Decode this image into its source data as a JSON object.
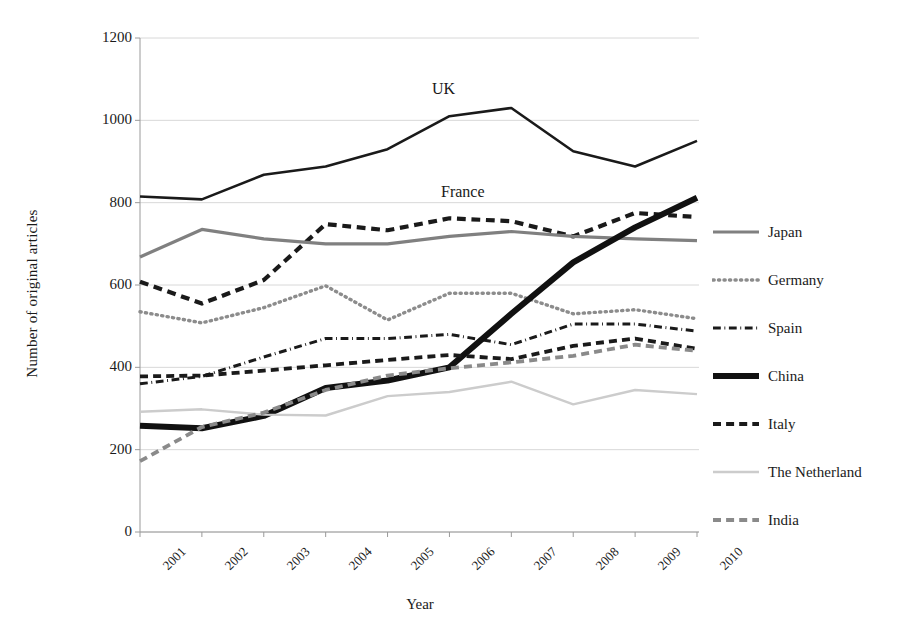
{
  "chart_data": {
    "type": "line",
    "title": "",
    "xlabel": "Year",
    "ylabel": "Number of original articles",
    "x": [
      2001,
      2002,
      2003,
      2004,
      2005,
      2006,
      2007,
      2008,
      2009,
      2010
    ],
    "categories": [
      "2001",
      "2002",
      "2003",
      "2004",
      "2005",
      "2006",
      "2007",
      "2008",
      "2009",
      "2010"
    ],
    "xlim": [
      2001,
      2010
    ],
    "ylim": [
      0,
      1200
    ],
    "yticks": [
      0,
      200,
      400,
      600,
      800,
      1000,
      1200
    ],
    "ytick_labels": [
      "0",
      "200",
      "400",
      "600",
      "800",
      "1000",
      "1200"
    ],
    "grid": "horizontal",
    "legend_position": "right",
    "series": [
      {
        "name": "UK",
        "values": [
          815,
          808,
          868,
          888,
          930,
          1010,
          1030,
          925,
          888,
          950
        ],
        "style": "solid",
        "color": "#1a1a1a",
        "width": 2.6,
        "in_legend": false,
        "annotated": true
      },
      {
        "name": "France",
        "values": [
          608,
          555,
          612,
          748,
          733,
          762,
          755,
          718,
          775,
          765
        ],
        "style": "dashed",
        "color": "#1a1a1a",
        "width": 4.2,
        "in_legend": false,
        "annotated": true
      },
      {
        "name": "Japan",
        "values": [
          668,
          735,
          712,
          700,
          700,
          718,
          730,
          718,
          712,
          708
        ],
        "style": "solid",
        "color": "#808080",
        "width": 3.2,
        "in_legend": true
      },
      {
        "name": "Germany",
        "values": [
          535,
          508,
          545,
          598,
          515,
          580,
          580,
          530,
          540,
          518
        ],
        "style": "dotted",
        "color": "#8c8c8c",
        "width": 3.4,
        "in_legend": true
      },
      {
        "name": "Spain",
        "values": [
          360,
          378,
          425,
          470,
          470,
          480,
          455,
          505,
          505,
          488
        ],
        "style": "dashdot",
        "color": "#1a1a1a",
        "width": 3.0,
        "in_legend": true
      },
      {
        "name": "China",
        "values": [
          258,
          252,
          282,
          350,
          368,
          400,
          530,
          655,
          740,
          812
        ],
        "style": "solid",
        "color": "#111111",
        "width": 6.0,
        "in_legend": true
      },
      {
        "name": "Italy",
        "values": [
          378,
          380,
          392,
          405,
          418,
          430,
          420,
          452,
          470,
          445
        ],
        "style": "dashed",
        "color": "#1a1a1a",
        "width": 3.8,
        "in_legend": true
      },
      {
        "name": "The Netherland",
        "values": [
          292,
          298,
          285,
          283,
          330,
          340,
          365,
          310,
          345,
          335
        ],
        "style": "solid",
        "color": "#cccccc",
        "width": 2.4,
        "in_legend": true
      },
      {
        "name": "India",
        "values": [
          172,
          255,
          290,
          345,
          380,
          398,
          412,
          428,
          455,
          440
        ],
        "style": "dashed",
        "color": "#8a8a8a",
        "width": 3.8,
        "in_legend": true
      }
    ],
    "annotations": [
      {
        "text": "UK",
        "x": 2006,
        "y": 1090,
        "px": 432,
        "py": 80
      },
      {
        "text": "France",
        "x": 2006,
        "y": 830,
        "px": 441,
        "py": 183
      }
    ],
    "legend_entries": [
      {
        "label": "Japan",
        "style": "solid",
        "color": "#808080",
        "width": 3.2
      },
      {
        "label": "Germany",
        "style": "dotted",
        "color": "#8c8c8c",
        "width": 3.4
      },
      {
        "label": "Spain",
        "style": "dashdot",
        "color": "#1a1a1a",
        "width": 3.0
      },
      {
        "label": "China",
        "style": "solid",
        "color": "#111111",
        "width": 6.0
      },
      {
        "label": "Italy",
        "style": "dashed",
        "color": "#1a1a1a",
        "width": 3.8
      },
      {
        "label": "The Netherland",
        "style": "solid",
        "color": "#cccccc",
        "width": 2.4
      },
      {
        "label": "India",
        "style": "dashed",
        "color": "#8a8a8a",
        "width": 3.8
      }
    ]
  },
  "axes": {
    "y_title": "Number of original articles",
    "x_title": "Year",
    "y_ticks": [
      "0",
      "200",
      "400",
      "600",
      "800",
      "1000",
      "1200"
    ],
    "x_ticks": [
      "2001",
      "2002",
      "2003",
      "2004",
      "2005",
      "2006",
      "2007",
      "2008",
      "2009",
      "2010"
    ]
  },
  "colors": {
    "grid": "#d8d8d8",
    "axis": "#9a9a9a",
    "text": "#1a1a1a",
    "background": "#ffffff"
  }
}
